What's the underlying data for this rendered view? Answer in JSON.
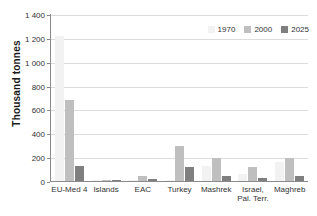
{
  "chart_data": {
    "type": "bar",
    "title": "",
    "xlabel": "",
    "ylabel": "Thousand tonnes",
    "ylim": [
      0,
      1400
    ],
    "ytick_step": 200,
    "grid": true,
    "legend_position": "top-right",
    "categories": [
      "EU-Med 4",
      "Islands",
      "EAC",
      "Turkey",
      "Mashrek",
      "Israel, Pal. Terr.",
      "Maghreb"
    ],
    "category_lines": [
      [
        "EU-Med 4",
        ""
      ],
      [
        "Islands",
        ""
      ],
      [
        "EAC",
        ""
      ],
      [
        "Turkey",
        ""
      ],
      [
        "Mashrek",
        ""
      ],
      [
        "Israel,",
        "Pal. Terr."
      ],
      [
        "Maghreb",
        ""
      ]
    ],
    "ytick_labels": [
      "0",
      "200",
      "400",
      "600",
      "800",
      "1 000",
      "1 200",
      "1 400"
    ],
    "ytick_values": [
      0,
      200,
      400,
      600,
      800,
      1000,
      1200,
      1400
    ],
    "series": [
      {
        "name": "1970",
        "color": "#f2f2f2",
        "values": [
          1215,
          6,
          4,
          10,
          130,
          60,
          160
        ]
      },
      {
        "name": "2000",
        "color": "#bfbfbf",
        "values": [
          675,
          8,
          45,
          290,
          195,
          120,
          195
        ]
      },
      {
        "name": "2025",
        "color": "#7f7f7f",
        "values": [
          125,
          12,
          20,
          115,
          40,
          25,
          45
        ]
      }
    ]
  },
  "legend": {
    "items": [
      {
        "label": "1970"
      },
      {
        "label": "2000"
      },
      {
        "label": "2025"
      }
    ]
  }
}
